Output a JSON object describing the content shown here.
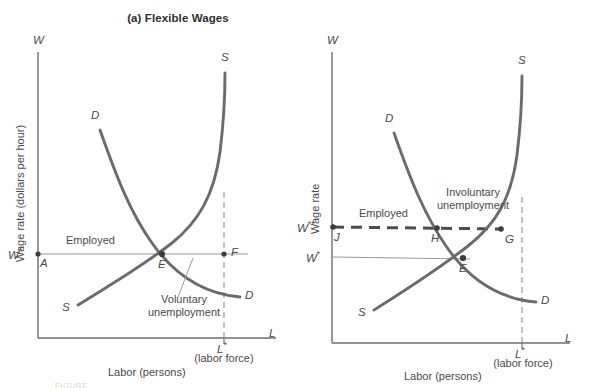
{
  "figure": {
    "panels": [
      {
        "id": "a",
        "title": "(a) Flexible Wages",
        "y_axis_label": "Wage rate (dollars per hour)",
        "y_axis_tip": "W",
        "x_axis_label": "Labor (persons)",
        "x_axis_tip": "L",
        "curve_labels": {
          "demand_top": "D",
          "demand_bottom": "D",
          "supply_top": "S",
          "supply_bottom": "S"
        },
        "point_labels": {
          "wage_equilibrium": "W*",
          "origin_point": "A",
          "equilibrium": "E",
          "labor_force_point": "F",
          "labor_force": "L*"
        },
        "annotations": {
          "employed": "Employed",
          "unemployment_line1": "Voluntary",
          "unemployment_line2": "unemployment",
          "labor_force_note": "(labor force)"
        }
      },
      {
        "id": "b",
        "title": "(b) Inflexible Wages",
        "y_axis_label": "Wage rate",
        "y_axis_tip": "W",
        "x_axis_label": "Labor (persons)",
        "x_axis_tip": "L",
        "curve_labels": {
          "demand_top": "D",
          "demand_bottom": "D",
          "supply_top": "S",
          "supply_bottom": "S"
        },
        "point_labels": {
          "wage_rigid": "W**",
          "wage_equilibrium": "W*",
          "rigid_axis_point": "J",
          "employment_point": "H",
          "labor_supplied_point": "G",
          "equilibrium": "E",
          "labor_force": "L*"
        },
        "annotations": {
          "employed": "Employed",
          "unemployment_line1": "Involuntary",
          "unemployment_line2": "unemployment",
          "labor_force_note": "(labor force)"
        }
      }
    ],
    "colors": {
      "curve": "#6b6b6b",
      "axis": "#6e6e6e",
      "thin_line": "#9a9a9a",
      "dashed": "#4d4d4d",
      "text": "#4a4a4a",
      "title_text": "#2e2e2e",
      "background": "#ffffff"
    },
    "footer_ghost_text": "FIGURE"
  }
}
